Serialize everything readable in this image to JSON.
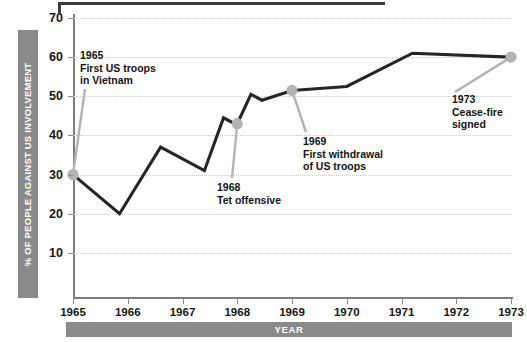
{
  "chart_data": {
    "type": "line",
    "title": "",
    "xlabel": "YEAR",
    "ylabel": "% OF PEOPLE AGAINST US INVOLVEMENT",
    "xlim": [
      1965,
      1973
    ],
    "ylim": [
      0,
      70
    ],
    "yticks": [
      10,
      20,
      30,
      40,
      50,
      60,
      70
    ],
    "xticks": [
      "1965",
      "1966",
      "1967",
      "1968",
      "1969",
      "1970",
      "1971",
      "1972",
      "1973"
    ],
    "grid": true,
    "legend": "none",
    "series": [
      {
        "name": "% of people against US involvement",
        "color": "#262626",
        "x": [
          1965,
          1965.85,
          1966.6,
          1967.4,
          1967.75,
          1967.95,
          1968,
          1968.25,
          1968.45,
          1969,
          1970,
          1971.2,
          1973
        ],
        "values": [
          30,
          20,
          37,
          31,
          44.5,
          43,
          43,
          50.5,
          49,
          51.5,
          52.5,
          61,
          60
        ]
      }
    ],
    "markers": [
      {
        "label": "1965",
        "x": 1965,
        "value": 30
      },
      {
        "label": "1968",
        "x": 1968,
        "value": 43
      },
      {
        "label": "1969",
        "x": 1969,
        "value": 51.5
      },
      {
        "label": "1973",
        "x": 1973,
        "value": 60
      }
    ],
    "marker_color": "#b3b3b3",
    "annotations": [
      {
        "year": "1965",
        "line1": "First US troops",
        "line2": "in Vietnam"
      },
      {
        "year": "1968",
        "line1": "Tet offensive",
        "line2": ""
      },
      {
        "year": "1969",
        "line1": "First withdrawal",
        "line2": "of US troops"
      },
      {
        "year": "1973",
        "line1": "Cease-fire",
        "line2": "signed"
      }
    ]
  },
  "axis": {
    "y_title": "% OF PEOPLE AGAINST US INVOLVEMENT",
    "x_title": "YEAR",
    "y_tick_labels": [
      "70",
      "60",
      "50",
      "40",
      "30",
      "20",
      "10"
    ],
    "x_tick_labels": [
      "1965",
      "1966",
      "1967",
      "1968",
      "1969",
      "1970",
      "1971",
      "1972",
      "1973"
    ]
  },
  "annotations": {
    "a1965": {
      "year": "1965",
      "l1": "First US troops",
      "l2": "in Vietnam"
    },
    "a1968": {
      "year": "1968",
      "l1": "Tet offensive"
    },
    "a1969": {
      "year": "1969",
      "l1": "First withdrawal",
      "l2": "of US troops"
    },
    "a1973": {
      "year": "1973",
      "l1": "Cease-fire",
      "l2": "signed"
    }
  },
  "colors": {
    "line": "#262626",
    "marker": "#b3b3b3",
    "leader": "#b3b3b3",
    "bar": "#8a8a8a",
    "grid": "#c9c9c9"
  }
}
